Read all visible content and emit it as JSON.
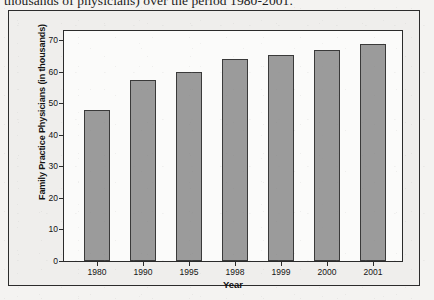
{
  "document": {
    "caption_line": "thousands of physicians) over the period 1980-2001."
  },
  "chart_data": {
    "type": "bar",
    "title": "",
    "xlabel": "Year",
    "ylabel": "Family Practice Physicians (in thousands)",
    "categories": [
      "1980",
      "1990",
      "1995",
      "1998",
      "1999",
      "2000",
      "2001"
    ],
    "values": [
      48,
      57.5,
      60,
      64,
      65.5,
      67,
      69
    ],
    "ylim": [
      0,
      73
    ],
    "yticks": [
      0,
      10,
      20,
      30,
      40,
      50,
      60,
      70
    ],
    "ytick_labels": [
      "0",
      "10",
      "20",
      "30",
      "40",
      "50",
      "60",
      "70"
    ],
    "grid": false,
    "legend": false,
    "bar_color": "#9b9b9b",
    "bar_edge_color": "#3a3a3a",
    "plot_background": "#fbfbfa",
    "figure_background": "#efeeec",
    "axis_color": "#2b2b2b"
  }
}
